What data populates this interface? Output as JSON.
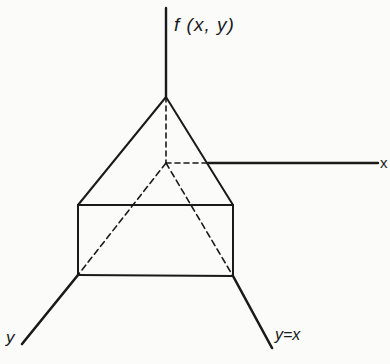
{
  "diagram": {
    "labels": {
      "z_axis": "f (x, y)",
      "x_axis": "x",
      "y_axis": "y",
      "diagonal": "y=x"
    },
    "colors": {
      "ink": "#1a1a1a",
      "background": "#fbfbfa"
    },
    "geometry": {
      "apex": [
        166,
        97
      ],
      "origin": [
        166,
        163
      ],
      "square_top_left": [
        78,
        205
      ],
      "square_top_right": [
        233,
        205
      ],
      "square_bottom_left": [
        78,
        275
      ],
      "square_bottom_right": [
        233,
        276
      ],
      "z_axis_top": [
        166,
        8
      ],
      "x_axis_end": [
        378,
        163
      ],
      "y_axis_end": [
        22,
        344
      ],
      "diagonal_end": [
        272,
        348
      ]
    }
  }
}
